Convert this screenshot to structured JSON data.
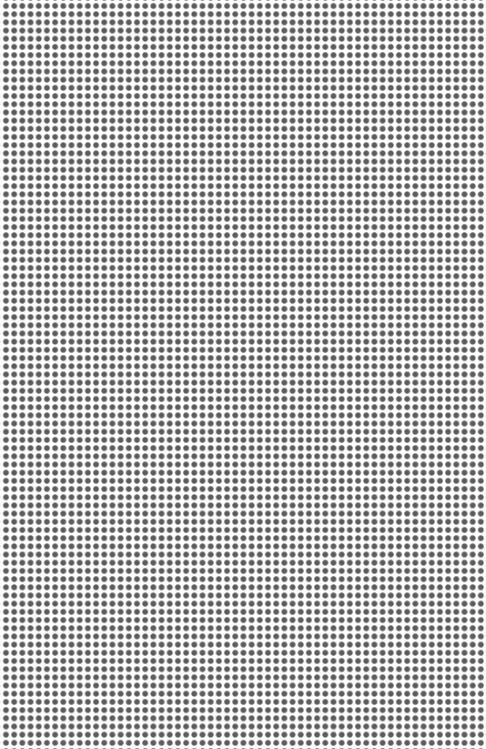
{
  "pattern": {
    "type": "dot-grid",
    "dot_color": "#5c5c5c",
    "background_color": "#ffffff",
    "spacing_px": 8.2,
    "dot_diameter_px": 5.5,
    "columns_approx": 59,
    "rows_approx": 91
  }
}
